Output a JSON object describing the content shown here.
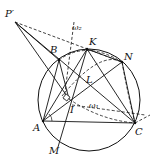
{
  "diagram": {
    "type": "geometry",
    "labels": {
      "P": "P′",
      "B": "B",
      "K": "K",
      "N": "N",
      "L": "L",
      "I": "I",
      "A": "A",
      "C": "C",
      "M": "M",
      "omega1": "ω₁",
      "omega2": "ω₂"
    },
    "points": {
      "P": [
        15,
        22
      ],
      "B": [
        59,
        60
      ],
      "K": [
        87,
        49
      ],
      "N": [
        122,
        62
      ],
      "A": [
        43,
        121
      ],
      "C": [
        135,
        123
      ],
      "M": [
        58,
        147
      ],
      "I": [
        69,
        99
      ]
    },
    "circumcircle": {
      "cx": 89,
      "cy": 100,
      "r": 51
    },
    "colors": {
      "stroke": "#111111",
      "background": "#ffffff"
    }
  }
}
